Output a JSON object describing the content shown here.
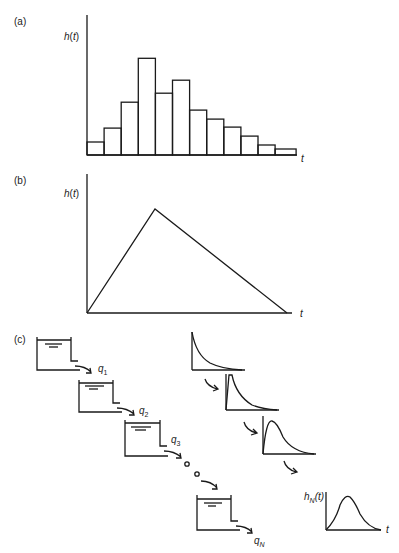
{
  "panels": {
    "a": {
      "label": "(a)",
      "ylabel": "h(t)",
      "xlabel": "t"
    },
    "b": {
      "label": "(b)",
      "ylabel": "h(t)",
      "xlabel": "t"
    },
    "c": {
      "label": "(c)",
      "flows": [
        "q1",
        "q2",
        "q3",
        "qN"
      ],
      "output_ylabel": "hN(t)",
      "output_xlabel": "t"
    }
  },
  "chart_data": [
    {
      "type": "bar",
      "title": "(a) Histogram unit hydrograph",
      "xlabel": "t",
      "ylabel": "h(t)",
      "categories": [
        "1",
        "2",
        "3",
        "4",
        "5",
        "6",
        "7",
        "8",
        "9",
        "10",
        "11",
        "12"
      ],
      "values": [
        13,
        27,
        53,
        97,
        62,
        75,
        45,
        36,
        28,
        19,
        10,
        6
      ],
      "grid": false
    },
    {
      "type": "line",
      "title": "(b) Triangular unit hydrograph",
      "xlabel": "t",
      "ylabel": "h(t)",
      "x": [
        0,
        68,
        200
      ],
      "values": [
        0,
        104,
        0
      ],
      "grid": false
    }
  ]
}
